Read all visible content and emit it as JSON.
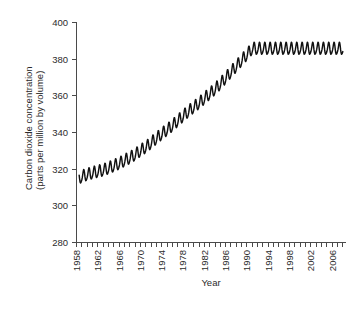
{
  "chart_data": {
    "type": "line",
    "title": "",
    "xlabel": "Year",
    "ylabel": "Carbon dioxide concentration (parts per million by volume)",
    "ylabel_line1": "Carbon dioxide concentration",
    "ylabel_line2": "(parts per million by volume)",
    "xlim": [
      1958,
      2008.5
    ],
    "ylim": [
      280,
      400
    ],
    "yticks": [
      280,
      300,
      320,
      340,
      360,
      380,
      400
    ],
    "ytick_labels": [
      "280",
      "300",
      "320",
      "340",
      "360",
      "380",
      "400"
    ],
    "xticks": [
      1958,
      1962,
      1966,
      1970,
      1974,
      1978,
      1982,
      1986,
      1990,
      1994,
      1998,
      2002,
      2006
    ],
    "xtick_labels": [
      "1958",
      "1962",
      "1966",
      "1970",
      "1974",
      "1978",
      "1982",
      "1986",
      "1990",
      "1994",
      "1998",
      "2002",
      "2006"
    ],
    "xtick_minor_interval": 1,
    "xtick_label_rotation": -90,
    "grid": false,
    "legend": false,
    "series_name": "Mauna Loa monthly mean CO2",
    "line_color": "#111111",
    "axis_color": "#4a4a4a",
    "background_color": "#ffffff",
    "seasonal_amplitude_ppm": 3.2,
    "seasonal_peak_month": 5,
    "x": [
      1958.5,
      1959.0,
      1959.5,
      1960.0,
      1960.5,
      1961.0,
      1961.5,
      1962.0,
      1962.5,
      1963.0,
      1963.5,
      1964.0,
      1964.5,
      1965.0,
      1965.5,
      1966.0,
      1966.5,
      1967.0,
      1967.5,
      1968.0,
      1968.5,
      1969.0,
      1969.5,
      1970.0,
      1970.5,
      1971.0,
      1971.5,
      1972.0,
      1972.5,
      1973.0,
      1973.5,
      1974.0,
      1974.5,
      1975.0,
      1975.5,
      1976.0,
      1976.5,
      1977.0,
      1977.5,
      1978.0,
      1978.5,
      1979.0,
      1979.5,
      1980.0,
      1980.5,
      1981.0,
      1981.5,
      1982.0,
      1982.5,
      1983.0,
      1983.5,
      1984.0,
      1984.5,
      1985.0,
      1985.5,
      1986.0,
      1986.5,
      1987.0,
      1987.5,
      1988.0,
      1988.5,
      1989.0,
      1989.5,
      1990.0,
      1990.5,
      1991.0,
      1991.5,
      1992.0,
      1992.5,
      1993.0,
      1993.5,
      1994.0,
      1994.5,
      1995.0,
      1995.5,
      1996.0,
      1996.5,
      1997.0,
      1997.5,
      1998.0,
      1998.5,
      1999.0,
      1999.5,
      2000.0,
      2000.5,
      2001.0,
      2001.5,
      2002.0,
      2002.5,
      2003.0,
      2003.5,
      2004.0,
      2004.5,
      2005.0,
      2005.5,
      2006.0,
      2006.5,
      2007.0,
      2007.5,
      2008.0
    ],
    "annual_mean_ppm": [
      315.0,
      315.7,
      316.4,
      316.9,
      317.3,
      317.7,
      318.2,
      318.5,
      318.9,
      319.3,
      319.8,
      320.4,
      321.0,
      321.6,
      322.3,
      322.9,
      323.7,
      324.5,
      325.3,
      326.0,
      326.9,
      327.7,
      328.8,
      329.9,
      330.9,
      331.8,
      332.9,
      334.2,
      335.4,
      336.6,
      337.8,
      339.0,
      340.2,
      341.3,
      342.4,
      343.6,
      344.9,
      346.2,
      347.5,
      348.8,
      350.1,
      351.3,
      352.5,
      353.6,
      354.7,
      355.9,
      357.1,
      358.4,
      359.7,
      360.9,
      362.2,
      363.5,
      364.9,
      366.4,
      368.0,
      369.6,
      371.2,
      372.8,
      374.4,
      376.0,
      377.6,
      379.2,
      380.8,
      382.4,
      384.0,
      385.6
    ]
  }
}
